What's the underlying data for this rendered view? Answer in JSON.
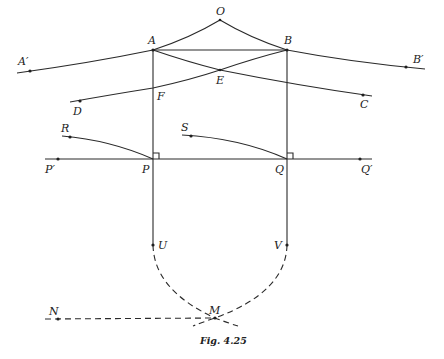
{
  "figure": {
    "caption": "Fig. 4.25",
    "colors": {
      "ink": "#2a2a2a",
      "background": "#ffffff"
    },
    "points": {
      "O": "O",
      "A": "A",
      "B": "B",
      "A_prime": "A′",
      "B_prime": "B′",
      "E": "E",
      "F": "F",
      "C": "C",
      "D": "D",
      "R": "R",
      "S": "S",
      "P": "P",
      "Q": "Q",
      "P_prime": "P′",
      "Q_prime": "Q′",
      "U": "U",
      "V": "V",
      "M": "M",
      "N": "N"
    },
    "elements": [
      {
        "type": "curve",
        "name": "arc A'-A-O-B-B'",
        "style": "solid"
      },
      {
        "type": "segment",
        "name": "AB",
        "style": "solid"
      },
      {
        "type": "segment",
        "name": "AC (through E)",
        "style": "solid"
      },
      {
        "type": "segment",
        "name": "DB (through F, E)",
        "style": "solid"
      },
      {
        "type": "segment",
        "name": "AU vertical",
        "style": "solid"
      },
      {
        "type": "segment",
        "name": "BV vertical",
        "style": "solid"
      },
      {
        "type": "segment",
        "name": "P'Q' horizontal",
        "style": "solid"
      },
      {
        "type": "curve",
        "name": "RP",
        "style": "solid"
      },
      {
        "type": "curve",
        "name": "SQ",
        "style": "solid"
      },
      {
        "type": "right-angle",
        "at": "P"
      },
      {
        "type": "right-angle",
        "at": "Q"
      },
      {
        "type": "curve",
        "name": "U to M (extended)",
        "style": "dashed"
      },
      {
        "type": "curve",
        "name": "V to M (extended)",
        "style": "dashed"
      },
      {
        "type": "segment",
        "name": "NM",
        "style": "dashed"
      }
    ]
  }
}
